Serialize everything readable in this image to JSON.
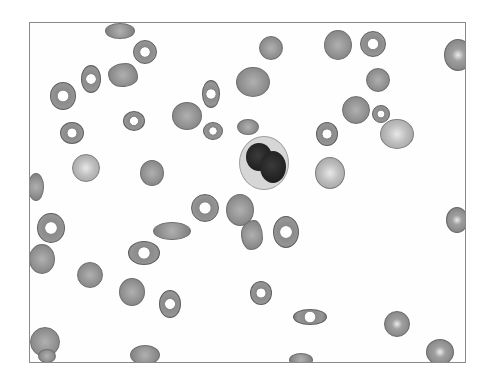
{
  "image": {
    "description": "Grayscale photomicrograph of a peripheral blood smear showing red blood cells (target cells, ovalocytes, poikilocytes) and one binucleated leukocyte",
    "frame_color": "#8a8a8a",
    "background": "#ffffff"
  },
  "cells": [
    {
      "type": "rbc",
      "x": 75,
      "y": 0,
      "w": 30,
      "h": 16
    },
    {
      "type": "target",
      "x": 103,
      "y": 17,
      "w": 24,
      "h": 24
    },
    {
      "type": "rbc",
      "x": 78,
      "y": 40,
      "w": 30,
      "h": 24,
      "shape": "bitten"
    },
    {
      "type": "target",
      "x": 51,
      "y": 42,
      "w": 20,
      "h": 28
    },
    {
      "type": "target",
      "x": 20,
      "y": 59,
      "w": 26,
      "h": 28
    },
    {
      "type": "target",
      "x": 30,
      "y": 99,
      "w": 24,
      "h": 22
    },
    {
      "type": "target",
      "x": 93,
      "y": 88,
      "w": 22,
      "h": 20
    },
    {
      "type": "pale",
      "x": 42,
      "y": 131,
      "w": 28,
      "h": 28
    },
    {
      "type": "rbc",
      "x": 110,
      "y": 137,
      "w": 24,
      "h": 26
    },
    {
      "type": "rbc",
      "x": -2,
      "y": 150,
      "w": 16,
      "h": 28
    },
    {
      "type": "rbc",
      "x": 142,
      "y": 79,
      "w": 30,
      "h": 28
    },
    {
      "type": "target",
      "x": 172,
      "y": 57,
      "w": 18,
      "h": 28
    },
    {
      "type": "target",
      "x": 173,
      "y": 99,
      "w": 20,
      "h": 18
    },
    {
      "type": "rbc",
      "x": 206,
      "y": 44,
      "w": 34,
      "h": 30
    },
    {
      "type": "rbc",
      "x": 207,
      "y": 96,
      "w": 22,
      "h": 16
    },
    {
      "type": "rbc",
      "x": 229,
      "y": 13,
      "w": 24,
      "h": 24
    },
    {
      "type": "rbc",
      "x": 294,
      "y": 7,
      "w": 28,
      "h": 30
    },
    {
      "type": "target",
      "x": 330,
      "y": 8,
      "w": 26,
      "h": 26
    },
    {
      "type": "rbc",
      "x": 336,
      "y": 45,
      "w": 24,
      "h": 24
    },
    {
      "type": "rbc",
      "x": 312,
      "y": 73,
      "w": 28,
      "h": 28
    },
    {
      "type": "target",
      "x": 342,
      "y": 82,
      "w": 18,
      "h": 18
    },
    {
      "type": "target",
      "x": 286,
      "y": 99,
      "w": 22,
      "h": 24
    },
    {
      "type": "pale",
      "x": 350,
      "y": 96,
      "w": 34,
      "h": 30
    },
    {
      "type": "pale",
      "x": 285,
      "y": 134,
      "w": 30,
      "h": 32
    },
    {
      "type": "shine",
      "x": 414,
      "y": 16,
      "w": 28,
      "h": 32
    },
    {
      "type": "shine",
      "x": 416,
      "y": 184,
      "w": 22,
      "h": 26
    },
    {
      "type": "target",
      "x": 7,
      "y": 190,
      "w": 28,
      "h": 30
    },
    {
      "type": "rbc",
      "x": -1,
      "y": 221,
      "w": 26,
      "h": 30
    },
    {
      "type": "rbc",
      "x": 47,
      "y": 239,
      "w": 26,
      "h": 26
    },
    {
      "type": "rbc",
      "x": 89,
      "y": 255,
      "w": 26,
      "h": 28
    },
    {
      "type": "target",
      "x": 98,
      "y": 218,
      "w": 32,
      "h": 24
    },
    {
      "type": "rbc",
      "x": 123,
      "y": 199,
      "w": 38,
      "h": 18
    },
    {
      "type": "target",
      "x": 161,
      "y": 171,
      "w": 28,
      "h": 28
    },
    {
      "type": "rbc",
      "x": 196,
      "y": 171,
      "w": 28,
      "h": 32
    },
    {
      "type": "rbc",
      "x": 211,
      "y": 197,
      "w": 22,
      "h": 30,
      "shape": "bitten"
    },
    {
      "type": "target",
      "x": 243,
      "y": 193,
      "w": 26,
      "h": 32
    },
    {
      "type": "target",
      "x": 129,
      "y": 267,
      "w": 22,
      "h": 28
    },
    {
      "type": "target",
      "x": 220,
      "y": 258,
      "w": 22,
      "h": 24
    },
    {
      "type": "target",
      "x": 263,
      "y": 286,
      "w": 34,
      "h": 16
    },
    {
      "type": "rbc",
      "x": 0,
      "y": 304,
      "w": 30,
      "h": 30
    },
    {
      "type": "rbc",
      "x": 8,
      "y": 326,
      "w": 18,
      "h": 14
    },
    {
      "type": "rbc",
      "x": 100,
      "y": 322,
      "w": 30,
      "h": 20
    },
    {
      "type": "shine",
      "x": 354,
      "y": 288,
      "w": 26,
      "h": 26
    },
    {
      "type": "shine",
      "x": 396,
      "y": 316,
      "w": 28,
      "h": 26
    },
    {
      "type": "rbc",
      "x": 259,
      "y": 330,
      "w": 24,
      "h": 14
    }
  ],
  "leukocyte": {
    "x": 209,
    "y": 113,
    "w": 50,
    "h": 54,
    "nuclei": [
      {
        "x": 6,
        "y": 6,
        "w": 26,
        "h": 28
      },
      {
        "x": 20,
        "y": 14,
        "w": 26,
        "h": 32
      }
    ]
  }
}
